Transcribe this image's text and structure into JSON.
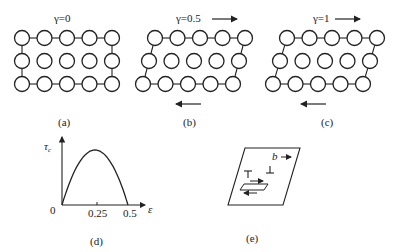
{
  "panels": {
    "a": {
      "caption": "(a)",
      "gamma_label": "γ=0"
    },
    "b": {
      "caption": "(b)",
      "gamma_label": "γ=0.5"
    },
    "c": {
      "caption": "(c)",
      "gamma_label": "γ=1"
    },
    "d": {
      "caption": "(d)"
    },
    "e": {
      "caption": "(e)",
      "burgers_label": "b"
    }
  },
  "lattice": {
    "rows": 3,
    "cols": 5,
    "circle_radius": 7.5,
    "spacing_x": 22.5,
    "spacing_y": 23,
    "shear_offsets_per_row_px": {
      "a": 0,
      "b": 6,
      "c": 7
    }
  },
  "chart_data": {
    "type": "line",
    "title": "",
    "xlabel": "ε",
    "ylabel": "τc",
    "origin_label": "0",
    "x_ticks": [
      "0.25",
      "0.5"
    ],
    "x": [
      0,
      0.05,
      0.1,
      0.15,
      0.2,
      0.25,
      0.3,
      0.35,
      0.4,
      0.45,
      0.5
    ],
    "values": [
      0,
      0.36,
      0.64,
      0.84,
      0.96,
      1.0,
      0.96,
      0.84,
      0.64,
      0.36,
      0
    ],
    "xlim": [
      0,
      0.55
    ],
    "ylim": [
      0,
      1.25
    ],
    "grid": false,
    "legend": "none"
  },
  "colors": {
    "stroke": "#222222",
    "background": "#ffffff"
  }
}
